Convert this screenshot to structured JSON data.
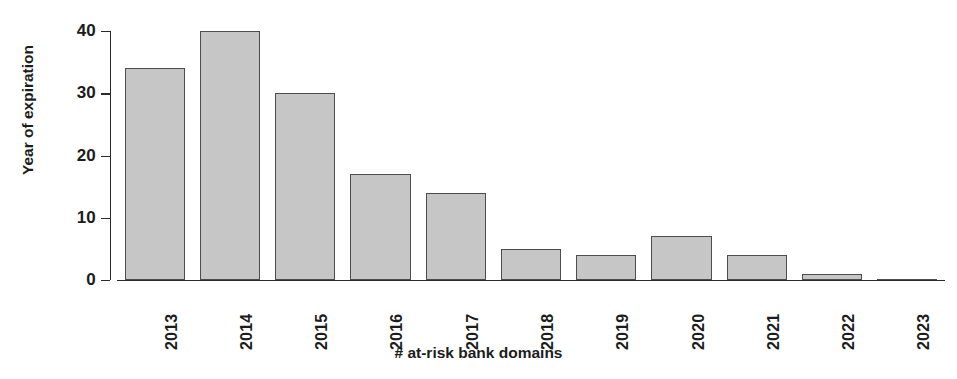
{
  "chart_data": {
    "type": "bar",
    "title": "",
    "subtitle": "",
    "xlabel": "# at-risk bank domains",
    "ylabel": "Year of expiration",
    "categories": [
      "2013",
      "2014",
      "2015",
      "2016",
      "2017",
      "2018",
      "2019",
      "2020",
      "2021",
      "2022",
      "2023"
    ],
    "values": [
      34,
      40,
      30,
      17,
      14,
      5,
      4,
      7,
      4,
      1,
      0
    ],
    "ylim": [
      0,
      40
    ],
    "yticks": [
      0,
      10,
      20,
      30,
      40
    ],
    "ytick_labels": [
      "0",
      "10",
      "20",
      "30",
      "40"
    ],
    "grid": false,
    "legend": null,
    "bar_fill_color": "#c6c6c6",
    "bar_border_color": "#4d4d4d",
    "axis_color": "#2b2b2b",
    "background_color": "#ffffff",
    "xtick_label_rotation": 90,
    "ylabel_rotation": 90,
    "annotations": []
  }
}
